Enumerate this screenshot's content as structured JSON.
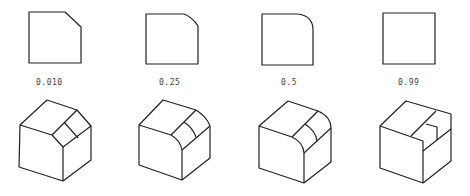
{
  "figure": {
    "panels": [
      {
        "label": "0.010",
        "corner": "chamfer"
      },
      {
        "label": "0.25",
        "corner": "small-round"
      },
      {
        "label": "0.5",
        "corner": "round"
      },
      {
        "label": "0.99",
        "corner": "sharp"
      }
    ],
    "colors": {
      "stroke": "#222222",
      "label": "#444444",
      "background": "#ffffff"
    }
  }
}
